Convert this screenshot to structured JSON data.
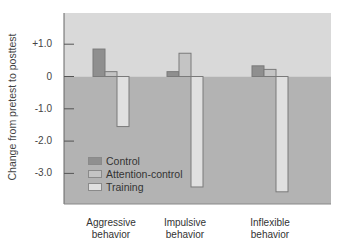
{
  "chart_data": {
    "type": "bar",
    "title": "",
    "xlabel": "",
    "ylabel": "Change from pretest to posttest",
    "categories": [
      "Aggressive behavior",
      "Impulsive behavior",
      "Inflexible behavior"
    ],
    "category_lines": [
      [
        "Aggressive",
        "behavior"
      ],
      [
        "Impulsive",
        "behavior"
      ],
      [
        "Inflexible",
        "behavior"
      ]
    ],
    "series": [
      {
        "name": "Control",
        "values": [
          0.85,
          0.15,
          0.33
        ],
        "color": "#8f8f8f"
      },
      {
        "name": "Attention-control",
        "values": [
          0.15,
          0.72,
          0.22
        ],
        "color": "#c4c4c4"
      },
      {
        "name": "Training",
        "values": [
          -1.55,
          -3.42,
          -3.57
        ],
        "color": "#e0e0e0"
      }
    ],
    "yticks": [
      1.0,
      0,
      -1.0,
      -2.0,
      -3.0
    ],
    "ytick_labels": [
      "+1.0",
      "0",
      "-1.0",
      "-2.0",
      "-3.0"
    ],
    "ylim": [
      -4.0,
      2.0
    ],
    "grid": false,
    "legend_position": "lower-left inside plot",
    "background": {
      "positive_region": "#d9d9d9",
      "negative_region": "#b3b3b3"
    }
  }
}
